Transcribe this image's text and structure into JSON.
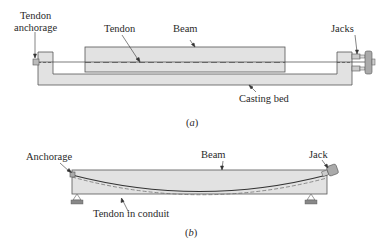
{
  "figure_a": {
    "caption": "a",
    "labels": {
      "tendon_anchorage_line1": "Tendon",
      "tendon_anchorage_line2": "anchorage",
      "tendon": "Tendon",
      "beam": "Beam",
      "jacks": "Jacks",
      "casting_bed": "Casting bed"
    }
  },
  "figure_b": {
    "caption": "b",
    "labels": {
      "anchorage": "Anchorage",
      "beam": "Beam",
      "jack": "Jack",
      "tendon_in_conduit": "Tendon in conduit"
    }
  },
  "colors": {
    "fill": "#e2e2e2",
    "stroke": "#555555",
    "tendon": "#333333",
    "support": "#777777"
  }
}
